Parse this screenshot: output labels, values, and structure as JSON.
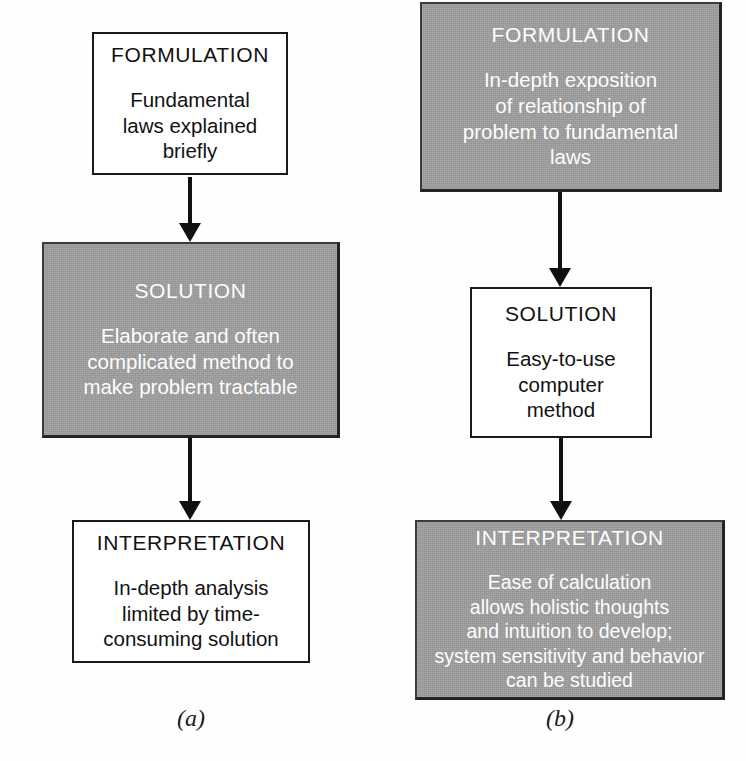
{
  "figure": {
    "panels": [
      {
        "id": "a",
        "caption": "(a)",
        "boxes": [
          {
            "name": "formulation",
            "style": "white",
            "heading": "FORMULATION",
            "body": "Fundamental\nlaws explained\nbriefly"
          },
          {
            "name": "solution",
            "style": "gray",
            "heading": "SOLUTION",
            "body": "Elaborate and often\ncomplicated method to\nmake problem tractable"
          },
          {
            "name": "interpretation",
            "style": "white",
            "heading": "INTERPRETATION",
            "body": "In-depth analysis\nlimited by time-\nconsuming solution"
          }
        ]
      },
      {
        "id": "b",
        "caption": "(b)",
        "boxes": [
          {
            "name": "formulation",
            "style": "gray",
            "heading": "FORMULATION",
            "body": "In-depth exposition\nof relationship of\nproblem to fundamental\nlaws"
          },
          {
            "name": "solution",
            "style": "white",
            "heading": "SOLUTION",
            "body": "Easy-to-use\ncomputer\nmethod"
          },
          {
            "name": "interpretation",
            "style": "gray",
            "heading": "INTERPRETATION",
            "body": "Ease of calculation\nallows holistic thoughts\nand intuition to develop;\nsystem sensitivity and behavior\ncan be studied"
          }
        ]
      }
    ],
    "colors": {
      "gray_fill": "#9d9d9d",
      "gray_text": "#fdfdfd",
      "white_fill": "#ffffff",
      "ink": "#121212"
    }
  }
}
